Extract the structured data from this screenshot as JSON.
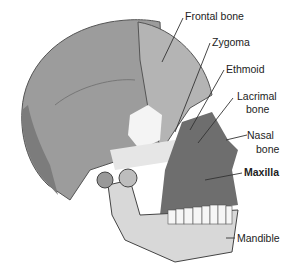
{
  "diagram": {
    "labels": [
      {
        "id": "frontal",
        "text": "Frontal bone",
        "bold": false
      },
      {
        "id": "zygoma",
        "text": "Zygoma",
        "bold": false
      },
      {
        "id": "ethmoid",
        "text": "Ethmoid",
        "bold": false
      },
      {
        "id": "lacrimal_1",
        "text": "Lacrimal",
        "bold": false
      },
      {
        "id": "lacrimal_2",
        "text": "bone",
        "bold": false
      },
      {
        "id": "nasal_1",
        "text": "Nasal",
        "bold": false
      },
      {
        "id": "nasal_2",
        "text": "bone",
        "bold": false
      },
      {
        "id": "maxilla",
        "text": "Maxilla",
        "bold": true
      },
      {
        "id": "mandible",
        "text": "Mandible",
        "bold": false
      }
    ],
    "colors": {
      "cranium": "#9c9c9c",
      "frontal": "#b4b4b4",
      "occipital": "#7c7c7c",
      "maxilla": "#6e6e6e",
      "mandible": "#d8d8d8",
      "zygoma_highlight": "#ffffff",
      "leader_line": "#333333"
    }
  }
}
